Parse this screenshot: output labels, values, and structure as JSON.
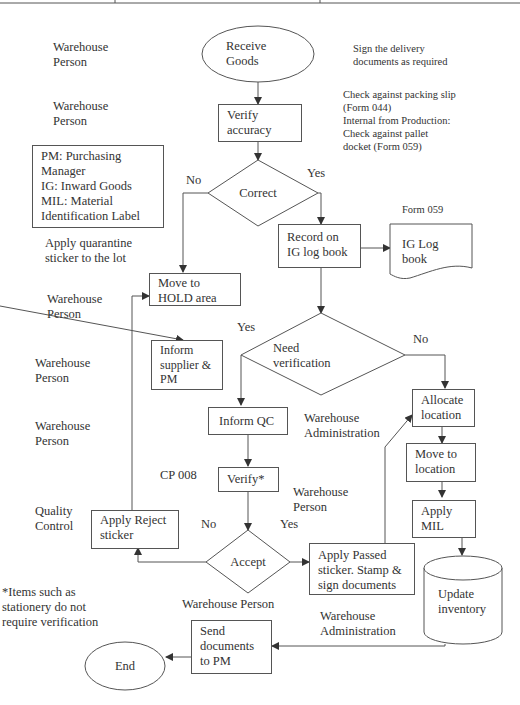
{
  "roles": {
    "r1": "Warehouse\nPerson",
    "r2": "Warehouse\nPerson",
    "r3": "Warehouse\nPerson",
    "r4": "Warehouse\nPerson",
    "r5": "Warehouse\nPerson",
    "r6": "Quality\nControl",
    "wh_admin_1": "Warehouse\nAdministration",
    "wh_person_mid": "Warehouse\nPerson",
    "wh_person_accept": "Warehouse Person",
    "wh_admin_2": "Warehouse\nAdministration"
  },
  "notes": {
    "sign_delivery": "Sign the delivery\ndocuments as required",
    "check_against": "Check against packing slip\n(Form 044)\nInternal from Production:\nCheck against pallet\ndocket (Form 059)",
    "legend": "PM: Purchasing\nManager\nIG: Inward Goods\nMIL: Material\nIdentification Label",
    "quarantine": "Apply quarantine\nsticker to the lot",
    "form_059": "Form 059",
    "cp_008": "CP 008",
    "footnote": "*Items such as\nstationery do not\nrequire verification"
  },
  "nodes": {
    "receive_goods": "Receive\nGoods",
    "verify_accuracy": "Verify\naccuracy",
    "correct": "Correct",
    "record_ig": "Record on\nIG log book",
    "ig_log_book": "IG Log\nbook",
    "move_hold": "Move to\nHOLD area",
    "inform_supplier": "Inform\nsupplier &\nPM",
    "need_verification": "Need\nverification",
    "inform_qc": "Inform QC",
    "verify_star": "Verify*",
    "accept": "Accept",
    "apply_reject": "Apply Reject\nsticker",
    "apply_passed": "Apply Passed\nsticker. Stamp &\nsign documents",
    "allocate_location": "Allocate\nlocation",
    "move_location": "Move to\nlocation",
    "apply_mil": "Apply\nMIL",
    "update_inventory": "Update\ninventory",
    "send_documents": "Send\ndocuments\nto PM",
    "end": "End"
  },
  "labels": {
    "correct_no": "No",
    "correct_yes": "Yes",
    "need_yes": "Yes",
    "need_no": "No",
    "accept_no": "No",
    "accept_yes": "Yes"
  }
}
